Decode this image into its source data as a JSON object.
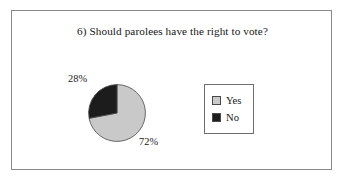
{
  "figure": {
    "title": "6) Should parolees have the right to vote?",
    "frame_border_color": "#8a8a8a",
    "background_color": "#ffffff"
  },
  "legend": {
    "position": "right",
    "border_color": "#6e6e6e",
    "items": [
      {
        "label": "Yes",
        "color": "#c9c9c9"
      },
      {
        "label": "No",
        "color": "#1c1c1c"
      }
    ]
  },
  "labels": {
    "no_pct": "28%",
    "yes_pct": "72%"
  },
  "chart_data": {
    "type": "pie",
    "title": "6) Should parolees have the right to vote?",
    "xlabel": "",
    "ylabel": "",
    "categories": [
      "Yes",
      "No"
    ],
    "values": [
      72,
      28
    ],
    "unit": "%",
    "data_labels": [
      "72%",
      "28%"
    ],
    "colors": [
      "#c9c9c9",
      "#1c1c1c"
    ],
    "slice_border_color": "#4a4a4a",
    "start_angle_deg": 0,
    "direction": "clockwise",
    "legend_position": "right",
    "grid": false,
    "series": [
      {
        "name": "Responses",
        "values": [
          72,
          28
        ]
      }
    ]
  }
}
